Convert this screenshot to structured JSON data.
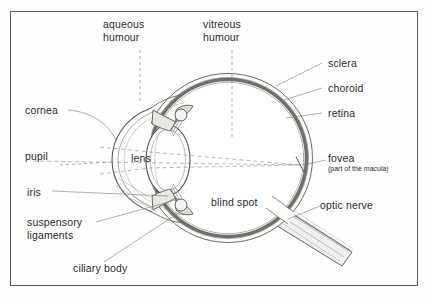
{
  "diagram": {
    "frame_color": "#5d5d5d",
    "background_color": "#fdfdfc",
    "ink_color": "#4a4a4a",
    "dark_layer_color": "#5a5550",
    "labels": [
      {
        "id": "aqueous-humour",
        "text": "aqueous\nhumour"
      },
      {
        "id": "vitreous-humour",
        "text": "vitreous\nhumour"
      },
      {
        "id": "sclera",
        "text": "sclera"
      },
      {
        "id": "choroid",
        "text": "choroid"
      },
      {
        "id": "retina",
        "text": "retina"
      },
      {
        "id": "cornea",
        "text": "cornea"
      },
      {
        "id": "pupil",
        "text": "pupil"
      },
      {
        "id": "lens",
        "text": "lens"
      },
      {
        "id": "iris",
        "text": "iris"
      },
      {
        "id": "suspensory-ligaments",
        "text": "suspensory\nligaments"
      },
      {
        "id": "ciliary-body",
        "text": "ciliary body"
      },
      {
        "id": "blind-spot",
        "text": "blind spot"
      },
      {
        "id": "fovea",
        "text": "fovea"
      },
      {
        "id": "fovea-note",
        "text": "(part of the macula)"
      },
      {
        "id": "optic-nerve",
        "text": "optic nerve"
      }
    ]
  }
}
